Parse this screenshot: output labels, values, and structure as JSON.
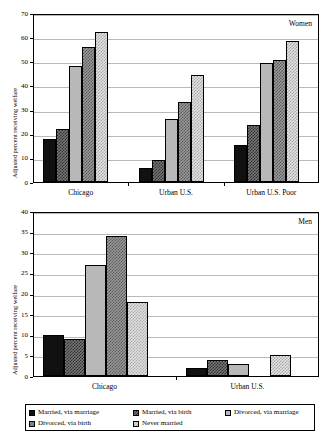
{
  "figure": {
    "ylabel": "Adjusted percent receiving welfare",
    "series_names": [
      "Married, via marriage",
      "Married, via birth",
      "Divorced, via marriage",
      "Divorced, via birth",
      "Never married"
    ],
    "colors": [
      "#111111",
      "#777777",
      "#b8b8b8",
      "#9a9a9a",
      "#e2e2e2"
    ]
  },
  "legend": {
    "items": [
      {
        "label": "Married, via marriage"
      },
      {
        "label": "Married, via birth"
      },
      {
        "label": "Divorced, via marriage"
      },
      {
        "label": "Divorced, via birth"
      },
      {
        "label": "Never married"
      }
    ]
  },
  "chart_data": [
    {
      "type": "bar",
      "title": "",
      "annotation": "Women",
      "xlabel": "",
      "ylabel": "Adjusted percent receiving welfare",
      "ylim": [
        0,
        70
      ],
      "yticks": [
        0,
        10,
        20,
        30,
        40,
        50,
        60,
        70
      ],
      "ytick_labels": [
        "0",
        "10",
        "20",
        "30",
        "40",
        "50",
        "60",
        "70"
      ],
      "grid": true,
      "legend_position": "below-figure",
      "categories": [
        "Chicago",
        "Urban U.S.",
        "Urban U.S. Poor"
      ],
      "series": [
        {
          "name": "Married, via marriage",
          "values": [
            18,
            6,
            15.5
          ]
        },
        {
          "name": "Married, via birth",
          "values": [
            22,
            9,
            23.5
          ]
        },
        {
          "name": "Divorced, via marriage",
          "values": [
            48,
            26,
            49.5
          ]
        },
        {
          "name": "Divorced, via birth",
          "values": [
            56,
            33,
            50.5
          ]
        },
        {
          "name": "Never married",
          "values": [
            62,
            44.5,
            58.5
          ]
        }
      ]
    },
    {
      "type": "bar",
      "title": "",
      "annotation": "Men",
      "xlabel": "",
      "ylabel": "Adjusted percent receiving welfare",
      "ylim": [
        0,
        40
      ],
      "yticks": [
        0,
        5,
        10,
        15,
        20,
        25,
        30,
        35,
        40
      ],
      "ytick_labels": [
        "0",
        "5",
        "10",
        "15",
        "20",
        "25",
        "30",
        "35",
        "40"
      ],
      "grid": true,
      "legend_position": "below",
      "categories": [
        "Chicago",
        "Urban U.S."
      ],
      "series": [
        {
          "name": "Married, via marriage",
          "values": [
            10,
            2
          ]
        },
        {
          "name": "Married, via birth",
          "values": [
            9,
            4
          ]
        },
        {
          "name": "Divorced, via marriage",
          "values": [
            27,
            3
          ]
        },
        {
          "name": "Divorced, via birth",
          "values": [
            34,
            0
          ]
        },
        {
          "name": "Never married",
          "values": [
            18,
            5
          ]
        }
      ]
    }
  ]
}
